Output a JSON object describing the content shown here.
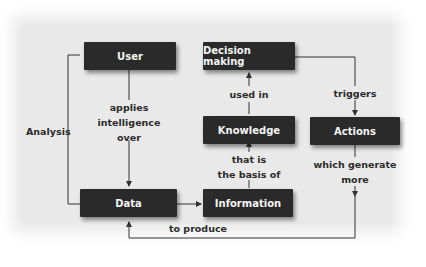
{
  "diagram": {
    "nodes": {
      "user": "User",
      "decision_making": "Decision making",
      "knowledge": "Knowledge",
      "actions": "Actions",
      "data": "Data",
      "information": "Information"
    },
    "edges": {
      "user_to_data": [
        "applies",
        "intelligence",
        "over"
      ],
      "analysis": "Analysis",
      "knowledge_to_decision": "used in",
      "information_to_knowledge": [
        "that is",
        "the basis of"
      ],
      "decision_to_actions": "triggers",
      "actions_to_data": [
        "which generate",
        "more"
      ],
      "data_to_information": "to produce"
    }
  }
}
